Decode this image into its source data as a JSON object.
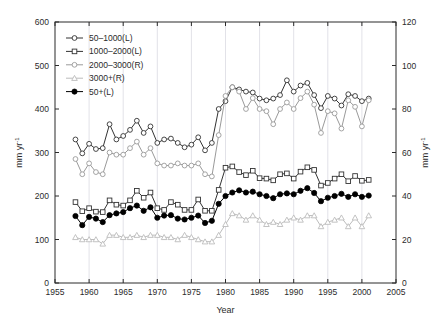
{
  "chart_data": {
    "type": "line",
    "title": "",
    "subtitle": "",
    "xlabel": "Year",
    "ylabel": "mm yr⁻¹",
    "ylabel_right": "mm yr⁻¹",
    "xlim": [
      1955,
      2005
    ],
    "ylim": [
      0,
      600
    ],
    "ylim_right": [
      0,
      120
    ],
    "xticks": [
      1955,
      1960,
      1965,
      1970,
      1975,
      1980,
      1985,
      1990,
      1995,
      2000,
      2005
    ],
    "yticks": [
      0,
      100,
      200,
      300,
      400,
      500,
      600
    ],
    "yticks_right": [
      0,
      20,
      40,
      60,
      80,
      100,
      120
    ],
    "grid": "vertical-only",
    "legend_position": "top-left",
    "x": [
      1958,
      1959,
      1960,
      1961,
      1962,
      1963,
      1964,
      1965,
      1966,
      1967,
      1968,
      1969,
      1970,
      1971,
      1972,
      1973,
      1974,
      1975,
      1976,
      1977,
      1978,
      1979,
      1980,
      1981,
      1982,
      1983,
      1984,
      1985,
      1986,
      1987,
      1988,
      1989,
      1990,
      1991,
      1992,
      1993,
      1994,
      1995,
      1996,
      1997,
      1998,
      1999,
      2000,
      2001
    ],
    "series": [
      {
        "name": "50–1000(L)",
        "axis": "left",
        "marker": "open-circle",
        "color": "#333333",
        "values": [
          330,
          298,
          320,
          308,
          310,
          365,
          330,
          338,
          352,
          373,
          345,
          360,
          322,
          330,
          332,
          322,
          312,
          318,
          335,
          305,
          322,
          400,
          418,
          450,
          445,
          440,
          438,
          424,
          420,
          424,
          432,
          466,
          440,
          454,
          460,
          432,
          402,
          430,
          424,
          408,
          434,
          430,
          418,
          424
        ]
      },
      {
        "name": "1000–2000(L)",
        "axis": "left",
        "marker": "open-square",
        "color": "#333333",
        "values": [
          186,
          165,
          172,
          164,
          163,
          190,
          180,
          178,
          190,
          212,
          196,
          208,
          172,
          168,
          186,
          180,
          168,
          168,
          192,
          166,
          166,
          214,
          265,
          268,
          255,
          248,
          258,
          241,
          240,
          236,
          250,
          252,
          240,
          256,
          266,
          260,
          224,
          230,
          240,
          250,
          234,
          246,
          235,
          237
        ]
      },
      {
        "name": "2000–3000(R)",
        "axis": "right",
        "marker": "open-circle",
        "color": "#9a9a9a",
        "values": [
          57,
          50,
          55,
          51,
          50,
          60,
          59,
          59,
          62,
          65,
          59,
          62,
          55,
          54,
          54,
          55,
          54,
          54,
          55,
          50,
          49,
          68,
          86,
          90,
          88,
          80,
          85,
          80,
          79,
          73,
          80,
          83,
          80,
          85,
          88,
          82,
          69,
          79,
          78,
          71,
          84,
          81,
          72,
          84
        ]
      },
      {
        "name": "3000+(R)",
        "axis": "right",
        "marker": "open-triangle",
        "color": "#bcbcbc",
        "values": [
          21,
          20,
          20,
          20,
          18,
          22,
          22,
          21,
          21,
          22,
          21,
          22,
          22,
          21,
          21,
          20,
          22,
          21,
          20,
          19,
          19,
          22,
          27,
          32,
          31,
          29,
          31,
          29,
          27,
          28,
          27,
          29,
          30,
          29,
          31,
          31,
          26,
          28,
          29,
          30,
          26,
          30,
          26,
          31
        ]
      },
      {
        "name": "50+(L)",
        "axis": "left",
        "marker": "filled-circle",
        "color": "#000000",
        "values": [
          154,
          133,
          152,
          148,
          140,
          156,
          160,
          163,
          172,
          178,
          166,
          174,
          150,
          155,
          156,
          148,
          146,
          150,
          155,
          138,
          143,
          182,
          200,
          208,
          213,
          208,
          210,
          204,
          200,
          195,
          204,
          206,
          204,
          212,
          218,
          207,
          188,
          196,
          200,
          205,
          198,
          204,
          198,
          201
        ]
      }
    ]
  },
  "legend": {
    "items": [
      {
        "label": "50–1000(L)"
      },
      {
        "label": "1000–2000(L)"
      },
      {
        "label": "2000–3000(R)"
      },
      {
        "label": "3000+(R)"
      },
      {
        "label": "50+(L)"
      }
    ]
  },
  "axes": {
    "left_unit_base": "mm yr",
    "left_unit_exp": "-1",
    "right_unit_base": "mm yr",
    "right_unit_exp": "-1",
    "x_title": "Year"
  },
  "colors": {
    "frame": "#2b2b2b",
    "grid": "#e2e2e8",
    "series_dark": "#333333",
    "series_gray": "#9a9a9a",
    "series_light": "#bcbcbc",
    "series_black": "#000000"
  }
}
